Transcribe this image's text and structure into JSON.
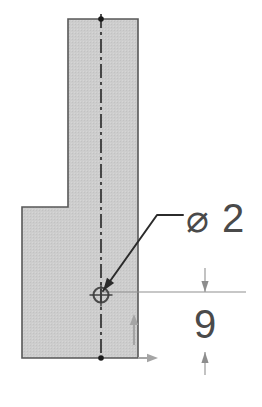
{
  "drawing": {
    "title": "Sectioned part profile with hole callout",
    "view_type": "section-view",
    "background_color": "#ffffff",
    "section_fill_color": "#cccccc",
    "outline_color": "#555555",
    "centerline_color": "#1a1a1a",
    "leader_color": "#2b2b2b",
    "dimension_color": "#8a8a8a",
    "text_color": "#4a4a4a",
    "part_outline": {
      "name": "flag-shaped-section-profile",
      "points": "68,19 138,19 138,358 22,358 22,207 68,207",
      "description": "L / flag shaped hatched section region"
    },
    "centerline": {
      "name": "vertical-centerline",
      "x": 101,
      "y_top": 14,
      "y_bottom": 363,
      "dash_pattern": "14,4,3,4"
    },
    "hole": {
      "name": "through-hole-center-mark",
      "center_x": 101,
      "center_y": 295,
      "radius": 7.5
    },
    "callouts": [
      {
        "id": "diameter-callout",
        "symbol": "⌀",
        "value": "2",
        "label_x": 186,
        "label_y": 232,
        "leader": {
          "from_x": 103,
          "from_y": 291,
          "bend_x": 157,
          "bend_y": 215,
          "to_x": 183,
          "to_y": 215
        }
      }
    ],
    "dimensions": [
      {
        "id": "vertical-dimension-9",
        "value": "9",
        "text_x": 205,
        "text_y": 338,
        "line_x": 205,
        "arrow_top_y": 268,
        "arrow_bottom_y": 375,
        "tip_top_y": 292,
        "tip_bottom_y": 352,
        "extension_line": {
          "from_x": 101,
          "to_x": 246,
          "y": 292
        }
      }
    ],
    "axis_markers": [
      {
        "id": "y-axis-arrow",
        "direction": "up",
        "x": 134,
        "y_tail": 345,
        "y_tip": 314
      },
      {
        "id": "x-axis-arrow",
        "direction": "right",
        "y": 358,
        "x_tail": 138,
        "x_tip": 158
      }
    ]
  }
}
